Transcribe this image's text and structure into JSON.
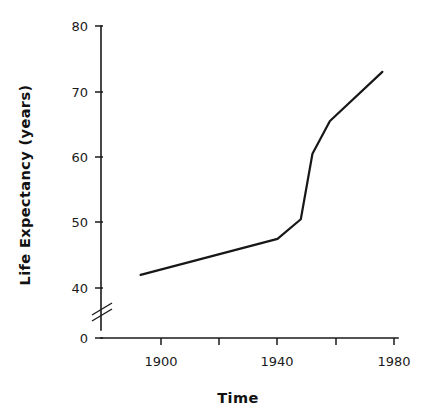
{
  "chart_data": {
    "type": "line",
    "title": "",
    "xlabel": "Time",
    "ylabel": "Life  Expectancy  (years)",
    "xlim": [
      1885,
      1985
    ],
    "ylim": [
      38,
      80
    ],
    "grid": false,
    "legend": "none",
    "axis_break": {
      "axis": "y",
      "between": [
        0,
        38
      ],
      "symbol": "double-slash"
    },
    "xticks": [
      1900,
      1920,
      1940,
      1960,
      1980
    ],
    "xtick_labels": [
      "1900",
      "",
      "1940",
      "",
      "1980"
    ],
    "yticks": [
      0,
      40,
      50,
      60,
      70,
      80
    ],
    "ytick_labels": [
      "0",
      "40",
      "50",
      "60",
      "70",
      "80"
    ],
    "series": [
      {
        "name": "Life Expectancy",
        "color": "#171717",
        "x": [
          1893,
          1940,
          1948,
          1952,
          1958,
          1976
        ],
        "y": [
          42.0,
          47.5,
          50.5,
          60.5,
          65.5,
          73.0
        ]
      }
    ]
  },
  "axis_labels": {
    "y_title": "Life  Expectancy  (years)",
    "x_title": "Time",
    "y_ticks": [
      {
        "value": 80,
        "label": "80"
      },
      {
        "value": 70,
        "label": "70"
      },
      {
        "value": 60,
        "label": "60"
      },
      {
        "value": 50,
        "label": "50"
      },
      {
        "value": 40,
        "label": "40"
      },
      {
        "value": 0,
        "label": "0"
      }
    ],
    "x_ticks": [
      {
        "value": 1900,
        "label": "1900"
      },
      {
        "value": 1920,
        "label": ""
      },
      {
        "value": 1940,
        "label": "1940"
      },
      {
        "value": 1960,
        "label": ""
      },
      {
        "value": 1980,
        "label": "1980"
      }
    ]
  },
  "colors": {
    "line": "#171717",
    "axis": "#1a1a1a",
    "text": "#111111",
    "background": "#ffffff"
  }
}
